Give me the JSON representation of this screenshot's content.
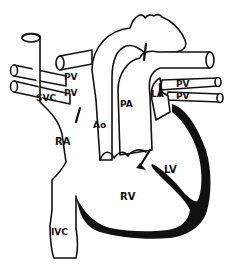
{
  "diagram": {
    "type": "anatomical heart diagram",
    "colors": {
      "stroke": "#111111",
      "fill": "#ffffff",
      "myocardium": "#111111"
    },
    "labels": {
      "svc": "SVC",
      "pv_left_upper": "PV",
      "pv_left_lower": "PV",
      "ao": "Ao",
      "pa": "PA",
      "la": "LA",
      "pv_right_upper": "PV",
      "pv_right_lower": "PV",
      "ra": "RA",
      "lv": "LV",
      "rv": "RV",
      "ivc": "IVC"
    }
  }
}
